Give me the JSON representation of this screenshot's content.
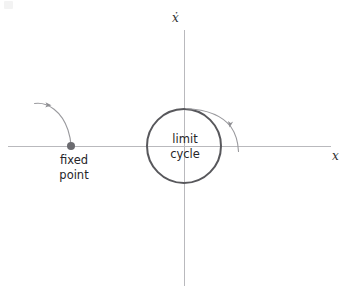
{
  "figure": {
    "width": 348,
    "height": 296,
    "background": "#ffffff"
  },
  "axes": {
    "horizontal": {
      "label": "x",
      "icon": "x-axis-line",
      "y": 146,
      "x_start": 8,
      "x_end": 331,
      "color": "#b9b9bd"
    },
    "vertical": {
      "label": "ẋ",
      "icon": "xdot-axis-line",
      "x": 184,
      "y_start": 30,
      "y_end": 286,
      "color": "#b9b9bd"
    },
    "origin": {
      "x": 184,
      "y": 146
    }
  },
  "limit_cycle": {
    "label": "limit\ncycle",
    "center_x": 184,
    "center_y": 146,
    "radius": 37,
    "color": "#58585c",
    "stroke_width": 2
  },
  "fixed_point": {
    "label": "fixed\npoint",
    "x": 71,
    "y": 146,
    "radius": 4,
    "color": "#6b6b70"
  },
  "trajectories": [
    {
      "name": "trajectory-into-fixed-point",
      "description": "curve spiralling inward toward the fixed point",
      "color": "#9a9a9e",
      "arrow_direction": "right-down"
    },
    {
      "name": "trajectory-onto-limit-cycle",
      "description": "curve approaching the limit cycle from outside",
      "color": "#9a9a9e",
      "arrow_direction": "up-left"
    }
  ],
  "colors": {
    "axis": "#b9b9bd",
    "cycle": "#58585c",
    "trajectory": "#9a9a9e",
    "point": "#6b6b70",
    "text": "#262629"
  }
}
